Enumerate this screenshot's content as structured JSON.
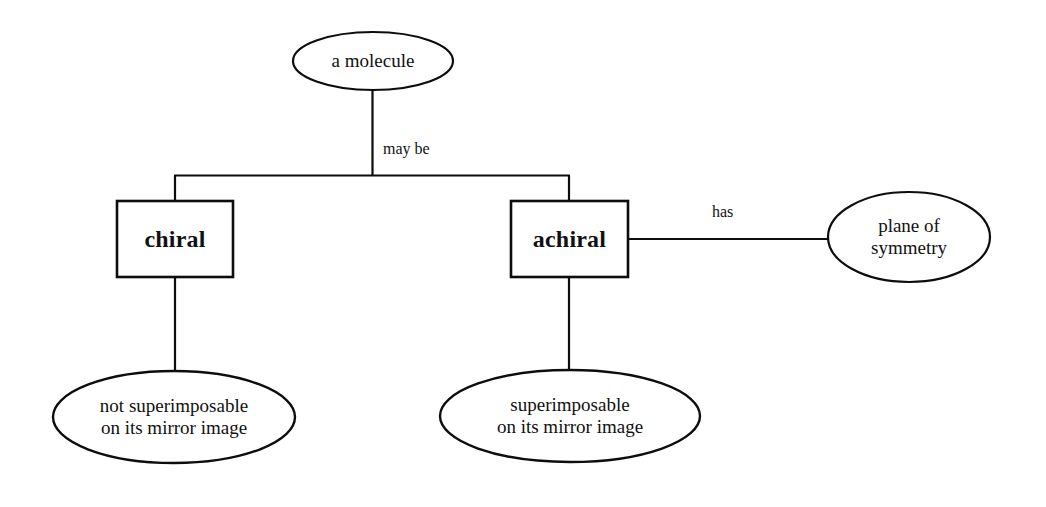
{
  "diagram": {
    "stroke_color": "#0d0d0d",
    "fill_color": "#ffffff",
    "nodes": {
      "root": {
        "label": "a molecule",
        "shape": "ellipse"
      },
      "chiral": {
        "label": "chiral",
        "shape": "rectangle"
      },
      "achiral": {
        "label": "achiral",
        "shape": "rectangle"
      },
      "plane_of_symmetry": {
        "label": "plane of\nsymmetry",
        "shape": "ellipse"
      },
      "not_superimposable": {
        "label": "not superimposable\non its mirror image",
        "shape": "ellipse"
      },
      "superimposable": {
        "label": "superimposable\non its mirror image",
        "shape": "ellipse"
      }
    },
    "edges": {
      "may_be": {
        "label": "may be"
      },
      "has": {
        "label": "has"
      },
      "chiral_to_not_superimposable": {
        "label": ""
      },
      "achiral_to_superimposable": {
        "label": ""
      }
    }
  }
}
